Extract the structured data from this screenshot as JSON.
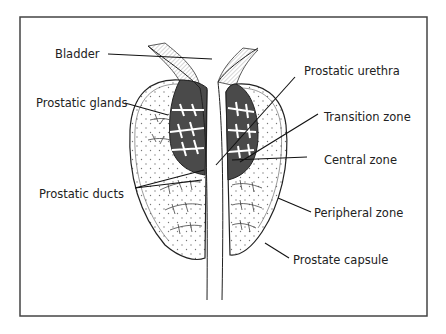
{
  "diagram": {
    "labels": {
      "bladder": "Bladder",
      "prostatic_glands": "Prostatic glands",
      "prostatic_ducts": "Prostatic ducts",
      "prostatic_urethra": "Prostatic urethra",
      "transition_zone": "Transition zone",
      "central_zone": "Central zone",
      "peripheral_zone": "Peripheral zone",
      "prostate_capsule": "Prostate capsule"
    },
    "colors": {
      "frame": "#444444",
      "ink": "#222222",
      "dark_zone": "#4a4a4a",
      "hatch": "#d8d8d8"
    }
  }
}
